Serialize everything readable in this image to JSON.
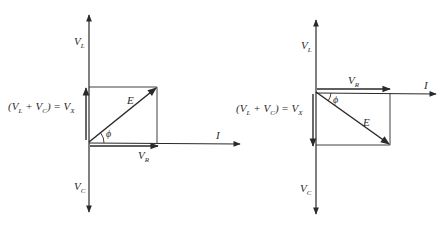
{
  "figure": {
    "stroke_color": "#2a2a2a",
    "background": "#ffffff"
  },
  "left_diagram": {
    "case": "inductive (E leads I)",
    "labels": {
      "vl": "V",
      "vl_sub": "L",
      "vc": "V",
      "vc_sub": "C",
      "vx_open": "(V",
      "vx_l_sub": "L",
      "vx_plus": "+ V",
      "vx_c_sub": "C",
      "vx_close": ") = V",
      "vx_x_sub": "X",
      "e": "E",
      "phi": "ϕ",
      "vr": "V",
      "vr_sub": "R",
      "i": "I"
    }
  },
  "right_diagram": {
    "case": "capacitive (E lags I)",
    "labels": {
      "vl": "V",
      "vl_sub": "L",
      "vc": "V",
      "vc_sub": "C",
      "vx_open": "(V",
      "vx_l_sub": "L",
      "vx_plus": "+ V",
      "vx_c_sub": "C",
      "vx_close": ") = V",
      "vx_x_sub": "X",
      "e": "E",
      "phi": "ϕ",
      "vr": "V",
      "vr_sub": "R",
      "i": "I"
    }
  }
}
